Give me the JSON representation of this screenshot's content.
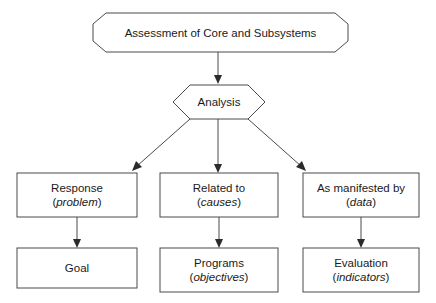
{
  "diagram": {
    "title_node": {
      "label": "Assessment of Core and Subsystems",
      "shape": "octagon"
    },
    "analysis_node": {
      "label": "Analysis",
      "shape": "hexagon"
    },
    "middle_row": [
      {
        "label": "Response",
        "sub": "problem",
        "open_paren": "(",
        "close_paren": ")"
      },
      {
        "label": "Related to",
        "sub": "causes",
        "open_paren": "(",
        "close_paren": ")"
      },
      {
        "label": "As manifested by",
        "sub": "data",
        "open_paren": "(",
        "close_paren": ")"
      }
    ],
    "bottom_row": [
      {
        "label": "Goal",
        "sub": "",
        "open_paren": "",
        "close_paren": ""
      },
      {
        "label": "Programs",
        "sub": "objectives",
        "open_paren": "(",
        "close_paren": ")"
      },
      {
        "label": "Evaluation",
        "sub": "indicators",
        "open_paren": "(",
        "close_paren": ")"
      }
    ],
    "colors": {
      "background": "#ffffff",
      "stroke": "#4a4a4a",
      "text": "#1a1a1a",
      "arrow": "#2b2b2b"
    }
  }
}
